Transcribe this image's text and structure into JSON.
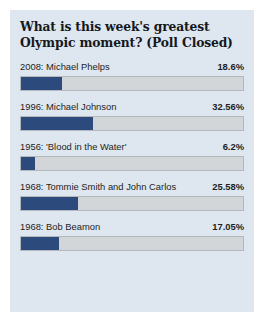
{
  "card": {
    "title": "What is this week's greatest Olympic moment? (Poll Closed)",
    "background_color": "#dee6ef"
  },
  "colors": {
    "bar_fill": "#2c4a7c",
    "bar_track": "#d3d6d8",
    "bar_border": "#b3b8bc",
    "text": "#1c1f23",
    "page_background": "#ffffff"
  },
  "chart_data": {
    "type": "bar",
    "title": "What is this week's greatest Olympic moment? (Poll Closed)",
    "xlabel": "",
    "ylabel": "",
    "xlim": [
      0,
      100
    ],
    "grid": false,
    "legend": false,
    "orientation": "horizontal",
    "unit": "%",
    "categories": [
      "2008: Michael Phelps",
      "1996: Michael Johnson",
      "1956: 'Blood in the Water'",
      "1968: Tommie Smith and John Carlos",
      "1968: Bob Beamon"
    ],
    "values": [
      18.6,
      32.56,
      6.2,
      25.58,
      17.05
    ],
    "value_labels": [
      "18.6%",
      "32.56%",
      "6.2%",
      "25.58%",
      "17.05%"
    ]
  },
  "rows": [
    {
      "label": "2008: Michael Phelps",
      "percent_label": "18.6%",
      "percent": 18.6
    },
    {
      "label": "1996: Michael Johnson",
      "percent_label": "32.56%",
      "percent": 32.56
    },
    {
      "label": "1956: 'Blood in the Water'",
      "percent_label": "6.2%",
      "percent": 6.2
    },
    {
      "label": "1968: Tommie Smith and John Carlos",
      "percent_label": "25.58%",
      "percent": 25.58
    },
    {
      "label": "1968: Bob Beamon",
      "percent_label": "17.05%",
      "percent": 17.05
    }
  ]
}
